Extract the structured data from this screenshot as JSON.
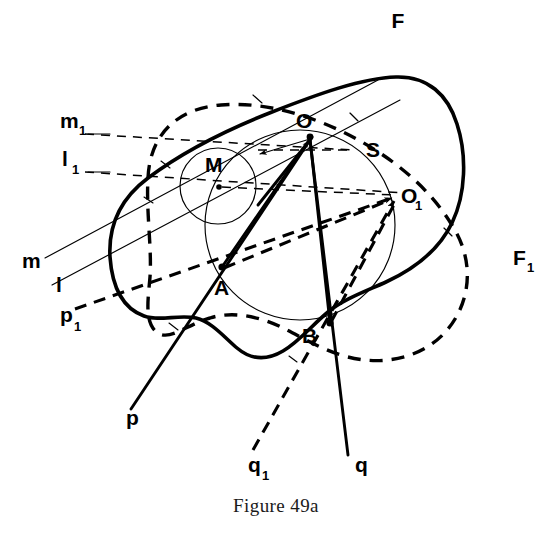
{
  "figure": {
    "caption": "Figure 49a",
    "title": "Figure 49a",
    "ink_color": "#000000",
    "background_color": "#ffffff",
    "width": 552,
    "height": 533
  },
  "labels": {
    "F": "F",
    "F1": "F",
    "F1_sub": "1",
    "S": "S",
    "M": "M",
    "O": "O",
    "O1": "O",
    "O1_sub": "1",
    "A": "A",
    "B": "B",
    "m": "m",
    "m1": "m",
    "m1_sub": "1",
    "l": "l",
    "l1": "l",
    "l1_sub": "1",
    "p": "p",
    "p1": "p",
    "p1_sub": "1",
    "q": "q",
    "q1": "q",
    "q1_sub": "1"
  },
  "points": {
    "O": {
      "x": 310,
      "y": 137,
      "label": "O"
    },
    "O1": {
      "x": 398,
      "y": 196,
      "label": "O1"
    },
    "M": {
      "x": 218,
      "y": 186,
      "label": "M"
    },
    "A": {
      "x": 222,
      "y": 267,
      "label": "A"
    },
    "B": {
      "x": 330,
      "y": 323,
      "label": "B"
    }
  },
  "circles": {
    "S": {
      "cx": 300,
      "cy": 225,
      "r": 95,
      "name": "circle-S",
      "stroke": "#000000"
    },
    "M": {
      "cx": 218,
      "cy": 186,
      "r": 38,
      "name": "circle-M",
      "stroke": "#000000"
    }
  },
  "curves": {
    "F": {
      "name": "boundary-F",
      "style": "solid-heavy"
    },
    "F1": {
      "name": "boundary-F1",
      "style": "dashed-heavy"
    }
  },
  "lines": {
    "m": {
      "name": "line-m",
      "style": "thin-solid"
    },
    "l": {
      "name": "line-l",
      "style": "thin-solid"
    },
    "m1": {
      "name": "line-m1",
      "style": "thin-dashed"
    },
    "l1": {
      "name": "line-l1",
      "style": "thin-dashed"
    },
    "p": {
      "name": "line-p",
      "style": "medium-solid"
    },
    "q": {
      "name": "line-q",
      "style": "medium-solid"
    },
    "p1": {
      "name": "line-p1",
      "style": "medium-dashed"
    },
    "q1": {
      "name": "line-q1",
      "style": "medium-dashed"
    }
  }
}
